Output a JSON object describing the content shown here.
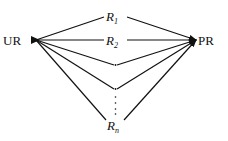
{
  "diagram": {
    "colors": {
      "line": "#111111",
      "background": "#ffffff"
    },
    "nodes": {
      "source": {
        "label": "UR"
      },
      "target": {
        "label": "PR"
      }
    },
    "routes": [
      {
        "name": "R",
        "subscript": "1"
      },
      {
        "name": "R",
        "subscript": "2"
      },
      {
        "name": "",
        "subscript": "",
        "marker": "."
      },
      {
        "name": "",
        "subscript": "",
        "marker": "."
      },
      {
        "name": "R",
        "subscript": "n"
      }
    ],
    "ellipsis": "⋮"
  }
}
